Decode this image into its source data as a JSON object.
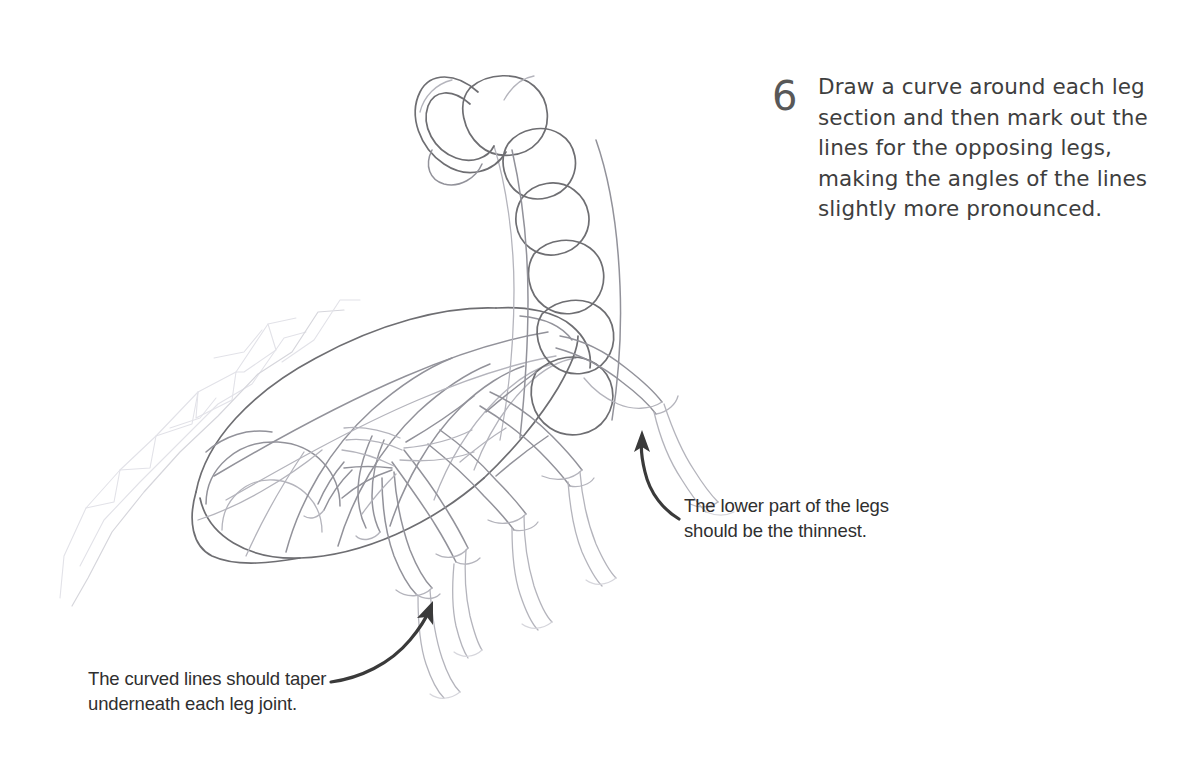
{
  "page": {
    "background_color": "#ffffff",
    "width": 1180,
    "height": 758
  },
  "step": {
    "number": "6",
    "number_color": "#585858",
    "text_color": "#3e3e3e",
    "lines": [
      "Draw a curve around each leg",
      "section and then mark out the",
      "lines for the opposing legs,",
      "making the angles of the lines",
      "slightly more pronounced."
    ],
    "text": "Draw a curve around each leg section and then mark out the lines for the opposing legs, making the angles of the lines slightly more pronounced."
  },
  "callouts": [
    {
      "id": "legs-thin",
      "color": "#2f2f2f",
      "lines": [
        "The lower part of the legs",
        "should be the thinnest."
      ],
      "text": "The lower part of the legs should be the thinnest.",
      "arrow": "curved-arrow-up-left",
      "arrow_color": "#3a3a3a"
    },
    {
      "id": "taper",
      "color": "#2f2f2f",
      "lines": [
        "The curved lines should taper",
        "underneath each leg joint."
      ],
      "text": "The curved lines should taper underneath each leg joint.",
      "arrow": "curved-arrow-up-right",
      "arrow_color": "#3a3a3a"
    }
  ],
  "artwork": {
    "subject": "scorpion",
    "medium": "pencil sketch construction drawing",
    "stroke_colors": {
      "dark": "#6e6e72",
      "mid": "#9a9aa0",
      "light": "#c4c4ca",
      "faint": "#dcdce1"
    },
    "parts": [
      "stinger-hook",
      "tail-segments",
      "abdomen-segments",
      "cephalothorax",
      "head",
      "pincer-construction-lines",
      "legs-left",
      "legs-right"
    ]
  }
}
